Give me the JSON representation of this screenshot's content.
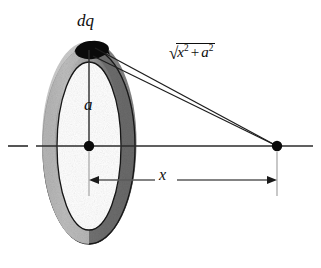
{
  "figure": {
    "type": "physics-diagram",
    "background_color": "#ffffff",
    "ink_color": "#0d0d0d",
    "ring": {
      "name": "charged-ring",
      "shape": "torus-ellipse",
      "center": {
        "x": 89,
        "y": 146
      },
      "radius_x": 46,
      "radius_y": 98,
      "tube_thickness": 14,
      "light_shade": "#b6b6b6",
      "dark_shade": "#6f6f6f",
      "outline_color": "#111111"
    },
    "charge_element": {
      "name": "dq",
      "label": "dq",
      "position": {
        "x": 89,
        "y": 48
      },
      "fill": "#0a0a0a"
    },
    "center_point": {
      "name": "ring-center",
      "position": {
        "x": 89,
        "y": 146
      }
    },
    "field_point": {
      "name": "field-point",
      "position": {
        "x": 277,
        "y": 146
      }
    },
    "radius_label": {
      "symbol": "a",
      "meaning": "ring radius"
    },
    "axis_distance_label": {
      "symbol": "x",
      "meaning": "distance along axis from ring center to field point"
    },
    "hypotenuse_label": {
      "radical": "√",
      "term1": "x",
      "exponent1": "2",
      "operator": "+",
      "term2": "a",
      "exponent2": "2",
      "meaning": "distance from charge element dq to field point"
    },
    "axis": {
      "name": "symmetry-axis",
      "y": 146,
      "dash_start_x": 8,
      "dash_end_x": 28,
      "solid_start_x": 36,
      "solid_end_x": 313
    },
    "dimension_line": {
      "y": 180,
      "start_x": 89,
      "end_x": 277,
      "arrowheads": "both"
    }
  }
}
